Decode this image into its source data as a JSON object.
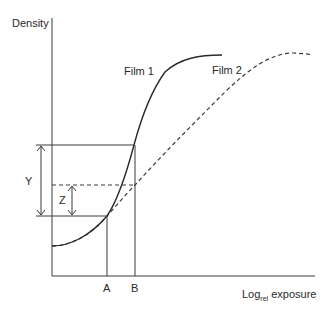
{
  "diagram": {
    "y_axis_label": "Density",
    "x_axis_label_main": "Log",
    "x_axis_label_sub": "rel",
    "x_axis_label_tail": " exposure",
    "curves": [
      {
        "name": "Film 1",
        "style": "solid"
      },
      {
        "name": "Film 2",
        "style": "dashed"
      }
    ],
    "markers": {
      "x": [
        "A",
        "B"
      ],
      "y": [
        "Y",
        "Z"
      ]
    },
    "colors": {
      "line": "#3a3a3a",
      "background": "#ffffff"
    }
  }
}
